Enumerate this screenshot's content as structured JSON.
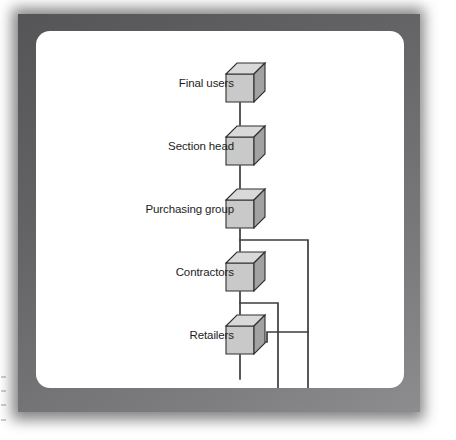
{
  "figure": {
    "kind": "isometric-cube-chain-diagram",
    "frame_color": "#636365",
    "panel_color": "#ffffff",
    "line_color": "#3c3c3c",
    "cube": {
      "front_face_color": "#c9c9c9",
      "top_face_color": "#d9d9d9",
      "side_face_color": "#a2a2a2",
      "outline_color": "#2e2e2e"
    },
    "nodes": [
      {
        "id": "final-users",
        "label": "Final users"
      },
      {
        "id": "section-head",
        "label": "Section head"
      },
      {
        "id": "purchasing-group",
        "label": "Purchasing group"
      },
      {
        "id": "contractors",
        "label": "Contractors"
      },
      {
        "id": "retailers",
        "label": "Retailers"
      }
    ],
    "connectors": [
      {
        "id": "final-users-to-section-head",
        "from": "final-users",
        "to": "section-head",
        "style": "straight-vertical"
      },
      {
        "id": "section-head-to-purchasing-group",
        "from": "section-head",
        "to": "purchasing-group",
        "style": "straight-vertical"
      },
      {
        "id": "purchasing-group-to-contractors",
        "from": "purchasing-group",
        "to": "contractors",
        "style": "straight-vertical"
      },
      {
        "id": "contractors-to-retailers",
        "from": "contractors",
        "to": "retailers",
        "style": "straight-vertical"
      },
      {
        "id": "purchasing-group-bypass-right",
        "from": "purchasing-group",
        "to": "bottom-edge",
        "style": "right-angle-branch"
      },
      {
        "id": "contractors-bypass-right",
        "from": "contractors",
        "to": "bottom-edge",
        "style": "right-angle-branch"
      },
      {
        "id": "retailers-side-tap",
        "from": "retailers",
        "to": "purchasing-group-bypass-right",
        "style": "right-angle-tap"
      },
      {
        "id": "retailers-outflow-down",
        "from": "retailers",
        "to": "bottom-edge",
        "style": "straight-vertical"
      }
    ]
  }
}
